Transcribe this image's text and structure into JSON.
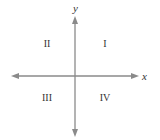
{
  "diagram": {
    "axes": {
      "x_label": "x",
      "y_label": "y",
      "color": "#8a8a8a"
    },
    "quadrants": [
      {
        "id": "I",
        "label": "I",
        "position": "upper-right"
      },
      {
        "id": "II",
        "label": "II",
        "position": "upper-left"
      },
      {
        "id": "III",
        "label": "III",
        "position": "lower-left"
      },
      {
        "id": "IV",
        "label": "IV",
        "position": "lower-right"
      }
    ],
    "text_color": "#333333"
  }
}
